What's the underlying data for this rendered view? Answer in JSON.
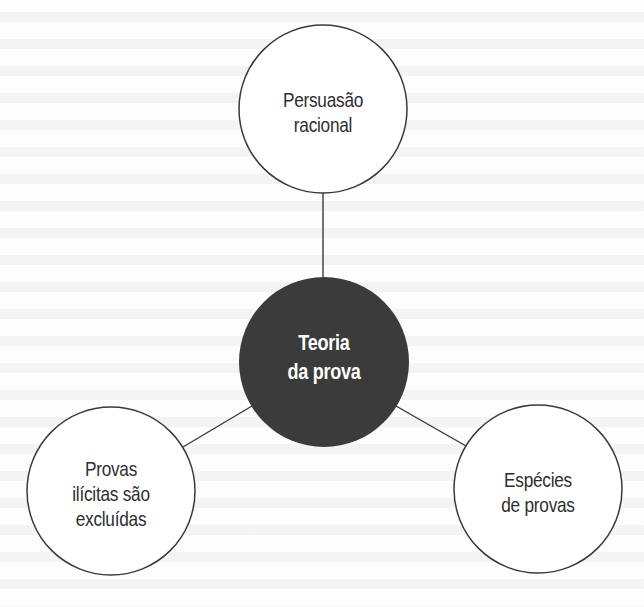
{
  "diagram": {
    "type": "concept-map",
    "center": {
      "id": "teoria-da-prova",
      "lines": [
        "Teoria",
        "da prova"
      ],
      "fill": "#3b3b3b",
      "text_color": "#ffffff"
    },
    "nodes": [
      {
        "id": "persuasao-racional",
        "lines": [
          "Persuasão",
          "racional"
        ],
        "position": "top"
      },
      {
        "id": "provas-ilicitas",
        "lines": [
          "Provas",
          "ilícitas são",
          "excluídas"
        ],
        "position": "bottom-left"
      },
      {
        "id": "especies-de-provas",
        "lines": [
          "Espécies",
          "de provas"
        ],
        "position": "bottom-right"
      }
    ],
    "edges": [
      {
        "from": "teoria-da-prova",
        "to": "persuasao-racional"
      },
      {
        "from": "teoria-da-prova",
        "to": "provas-ilicitas"
      },
      {
        "from": "teoria-da-prova",
        "to": "especies-de-provas"
      }
    ],
    "colors": {
      "stroke": "#3a3a3a",
      "node_fill": "#ffffff",
      "text": "#2e2e2e",
      "background": "#fdfdfd"
    }
  }
}
